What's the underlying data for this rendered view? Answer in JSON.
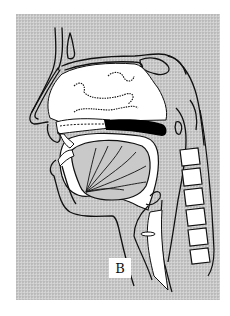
{
  "figure": {
    "type": "sagittal-section-head-neck",
    "label": "B",
    "colors": {
      "background": "#ffffff",
      "panel": "#c9c9c9",
      "outline": "#111111",
      "cavity": "#ffffff",
      "palate": "#000000"
    }
  }
}
